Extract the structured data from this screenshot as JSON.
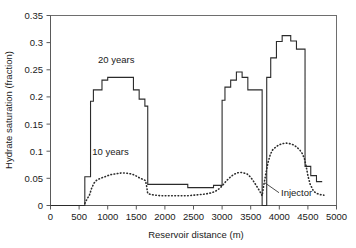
{
  "chart_data": {
    "type": "line",
    "title": "",
    "xlabel": "Reservoir distance (m)",
    "ylabel": "Hydrate saturation (fraction)",
    "xlim": [
      0,
      5000
    ],
    "ylim": [
      0,
      0.35
    ],
    "grid": false,
    "legend_position": "inline-annotations",
    "xticks": [
      0,
      500,
      1000,
      1500,
      2000,
      2500,
      3000,
      3500,
      4000,
      4500,
      5000
    ],
    "xtick_labels": [
      "0",
      "500",
      "1000",
      "1500",
      "2000",
      "2500",
      "3000",
      "3500",
      "4000",
      "4500",
      "5000"
    ],
    "yticks": [
      0,
      0.05,
      0.1,
      0.15,
      0.2,
      0.25,
      0.3,
      0.35
    ],
    "ytick_labels": [
      "0",
      "0.05",
      "0.1",
      "0.15",
      "0.2",
      "0.25",
      "0.3",
      "0.35"
    ],
    "annotations": [
      {
        "name": "series-label-20-years",
        "text": "20 years",
        "x": 1150,
        "y": 0.262
      },
      {
        "name": "series-label-10-years",
        "text": "10 years",
        "x": 1050,
        "y": 0.093
      },
      {
        "name": "injector-label",
        "text": "Injector",
        "x": 4030,
        "y": 0.018
      }
    ],
    "series": [
      {
        "name": "20 years",
        "style": "solid",
        "x": [
          0,
          600,
          600,
          700,
          700,
          750,
          750,
          900,
          900,
          1000,
          1000,
          1450,
          1450,
          1550,
          1550,
          1650,
          1650,
          1700,
          1700,
          2400,
          2400,
          2850,
          2850,
          3000,
          3000,
          3050,
          3050,
          3150,
          3150,
          3250,
          3250,
          3350,
          3350,
          3450,
          3450,
          3700,
          3700,
          3780,
          3780,
          3850,
          3850,
          3950,
          3950,
          4050,
          4050,
          4200,
          4200,
          4300,
          4300,
          4450,
          4450,
          4550,
          4550,
          4650,
          4650,
          4750
        ],
        "y": [
          0.0,
          0.0,
          0.053,
          0.053,
          0.192,
          0.192,
          0.213,
          0.213,
          0.231,
          0.231,
          0.236,
          0.236,
          0.213,
          0.213,
          0.196,
          0.196,
          0.183,
          0.183,
          0.039,
          0.039,
          0.033,
          0.033,
          0.037,
          0.037,
          0.194,
          0.194,
          0.218,
          0.218,
          0.231,
          0.231,
          0.246,
          0.246,
          0.236,
          0.236,
          0.213,
          0.213,
          0.0,
          0.0,
          0.236,
          0.236,
          0.272,
          0.272,
          0.302,
          0.302,
          0.313,
          0.313,
          0.303,
          0.303,
          0.288,
          0.288,
          0.072,
          0.072,
          0.055,
          0.055,
          0.044,
          0.044
        ]
      },
      {
        "name": "10 years",
        "style": "dotted",
        "x": [
          600,
          640,
          680,
          720,
          760,
          800,
          850,
          900,
          950,
          1000,
          1060,
          1120,
          1180,
          1240,
          1300,
          1360,
          1420,
          1470,
          1520,
          1570,
          1620,
          1660,
          1680,
          1700,
          1760,
          1840,
          1920,
          2000,
          2100,
          2200,
          2300,
          2400,
          2500,
          2600,
          2700,
          2800,
          2880,
          2950,
          3000,
          3040,
          3080,
          3140,
          3200,
          3260,
          3320,
          3380,
          3440,
          3500,
          3560,
          3620,
          3660,
          3700,
          3720,
          3760,
          3800,
          3840,
          3880,
          3940,
          4000,
          4060,
          4120,
          4180,
          4240,
          4300,
          4360,
          4400,
          4440,
          4470,
          4500,
          4540,
          4600,
          4660,
          4720,
          4780
        ],
        "y": [
          0.004,
          0.012,
          0.019,
          0.032,
          0.041,
          0.046,
          0.049,
          0.051,
          0.053,
          0.055,
          0.057,
          0.058,
          0.059,
          0.06,
          0.06,
          0.059,
          0.058,
          0.056,
          0.053,
          0.05,
          0.048,
          0.046,
          0.036,
          0.022,
          0.02,
          0.019,
          0.018,
          0.018,
          0.018,
          0.018,
          0.018,
          0.018,
          0.019,
          0.02,
          0.021,
          0.023,
          0.026,
          0.031,
          0.036,
          0.041,
          0.046,
          0.052,
          0.057,
          0.06,
          0.061,
          0.06,
          0.058,
          0.052,
          0.043,
          0.033,
          0.026,
          0.018,
          0.032,
          0.056,
          0.078,
          0.093,
          0.102,
          0.108,
          0.112,
          0.114,
          0.115,
          0.114,
          0.112,
          0.108,
          0.102,
          0.096,
          0.086,
          0.072,
          0.055,
          0.039,
          0.026,
          0.022,
          0.02,
          0.019
        ]
      }
    ]
  },
  "axes": {
    "y_axis_title": "Hydrate saturation (fraction)",
    "x_axis_title": "Reservoir distance (m)"
  }
}
